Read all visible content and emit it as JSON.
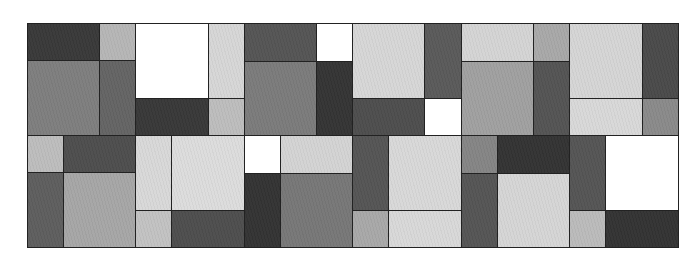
{
  "figure": {
    "bounds": {
      "x": 27,
      "y": 23,
      "width": 651,
      "height": 224
    },
    "palette": {
      "white": "#ffffff",
      "very_light": "#dadada",
      "light": "#c0c0c0",
      "mid_light": "#a6a6a6",
      "mid": "#7c7c7c",
      "mid_dark": "#5c5c5c",
      "dark": "#4a4a4a",
      "very_dark": "#353535",
      "border": "#222222"
    },
    "cells": [
      {
        "x": 27,
        "y": 23,
        "w": 72,
        "h": 37,
        "color": "#393939"
      },
      {
        "x": 99,
        "y": 23,
        "w": 36,
        "h": 37,
        "color": "#b6b6b6"
      },
      {
        "x": 27,
        "y": 60,
        "w": 72,
        "h": 75,
        "color": "#7e7e7e"
      },
      {
        "x": 99,
        "y": 60,
        "w": 36,
        "h": 75,
        "color": "#646464"
      },
      {
        "x": 135,
        "y": 23,
        "w": 73,
        "h": 75,
        "color": "#ffffff"
      },
      {
        "x": 208,
        "y": 23,
        "w": 36,
        "h": 75,
        "color": "#d6d6d6"
      },
      {
        "x": 135,
        "y": 98,
        "w": 73,
        "h": 37,
        "color": "#383838"
      },
      {
        "x": 208,
        "y": 98,
        "w": 36,
        "h": 37,
        "color": "#bdbdbd"
      },
      {
        "x": 244,
        "y": 23,
        "w": 72,
        "h": 38,
        "color": "#555555"
      },
      {
        "x": 316,
        "y": 23,
        "w": 36,
        "h": 38,
        "color": "#ffffff"
      },
      {
        "x": 244,
        "y": 61,
        "w": 72,
        "h": 74,
        "color": "#7b7b7b"
      },
      {
        "x": 316,
        "y": 61,
        "w": 36,
        "h": 74,
        "color": "#343434"
      },
      {
        "x": 352,
        "y": 23,
        "w": 72,
        "h": 75,
        "color": "#d6d6d6"
      },
      {
        "x": 424,
        "y": 23,
        "w": 37,
        "h": 75,
        "color": "#5a5a5a"
      },
      {
        "x": 352,
        "y": 98,
        "w": 72,
        "h": 37,
        "color": "#4e4e4e"
      },
      {
        "x": 424,
        "y": 98,
        "w": 37,
        "h": 37,
        "color": "#ffffff"
      },
      {
        "x": 461,
        "y": 23,
        "w": 72,
        "h": 38,
        "color": "#d4d4d4"
      },
      {
        "x": 533,
        "y": 23,
        "w": 36,
        "h": 38,
        "color": "#a8a8a8"
      },
      {
        "x": 461,
        "y": 61,
        "w": 72,
        "h": 74,
        "color": "#a0a0a0"
      },
      {
        "x": 533,
        "y": 61,
        "w": 36,
        "h": 74,
        "color": "#545454"
      },
      {
        "x": 569,
        "y": 23,
        "w": 73,
        "h": 75,
        "color": "#d5d5d5"
      },
      {
        "x": 642,
        "y": 23,
        "w": 36,
        "h": 75,
        "color": "#4a4a4a"
      },
      {
        "x": 569,
        "y": 98,
        "w": 73,
        "h": 37,
        "color": "#d8d8d8"
      },
      {
        "x": 642,
        "y": 98,
        "w": 36,
        "h": 37,
        "color": "#8a8a8a"
      },
      {
        "x": 27,
        "y": 135,
        "w": 36,
        "h": 37,
        "color": "#bdbdbd"
      },
      {
        "x": 63,
        "y": 135,
        "w": 72,
        "h": 37,
        "color": "#4e4e4e"
      },
      {
        "x": 27,
        "y": 172,
        "w": 36,
        "h": 75,
        "color": "#5e5e5e"
      },
      {
        "x": 63,
        "y": 172,
        "w": 72,
        "h": 75,
        "color": "#a6a6a6"
      },
      {
        "x": 135,
        "y": 135,
        "w": 36,
        "h": 75,
        "color": "#d8d8d8"
      },
      {
        "x": 171,
        "y": 135,
        "w": 73,
        "h": 75,
        "color": "#dcdcdc"
      },
      {
        "x": 135,
        "y": 210,
        "w": 36,
        "h": 37,
        "color": "#c2c2c2"
      },
      {
        "x": 171,
        "y": 210,
        "w": 73,
        "h": 37,
        "color": "#4e4e4e"
      },
      {
        "x": 244,
        "y": 135,
        "w": 36,
        "h": 38,
        "color": "#ffffff"
      },
      {
        "x": 280,
        "y": 135,
        "w": 72,
        "h": 38,
        "color": "#d3d3d3"
      },
      {
        "x": 244,
        "y": 173,
        "w": 36,
        "h": 74,
        "color": "#333333"
      },
      {
        "x": 280,
        "y": 173,
        "w": 72,
        "h": 74,
        "color": "#777777"
      },
      {
        "x": 352,
        "y": 135,
        "w": 36,
        "h": 75,
        "color": "#555555"
      },
      {
        "x": 388,
        "y": 135,
        "w": 73,
        "h": 75,
        "color": "#d8d8d8"
      },
      {
        "x": 352,
        "y": 210,
        "w": 36,
        "h": 37,
        "color": "#a8a8a8"
      },
      {
        "x": 388,
        "y": 210,
        "w": 73,
        "h": 37,
        "color": "#d8d8d8"
      },
      {
        "x": 461,
        "y": 135,
        "w": 36,
        "h": 38,
        "color": "#858585"
      },
      {
        "x": 497,
        "y": 135,
        "w": 72,
        "h": 38,
        "color": "#333333"
      },
      {
        "x": 461,
        "y": 173,
        "w": 36,
        "h": 74,
        "color": "#555555"
      },
      {
        "x": 497,
        "y": 173,
        "w": 72,
        "h": 74,
        "color": "#d5d5d5"
      },
      {
        "x": 569,
        "y": 135,
        "w": 36,
        "h": 75,
        "color": "#555555"
      },
      {
        "x": 605,
        "y": 135,
        "w": 73,
        "h": 75,
        "color": "#ffffff"
      },
      {
        "x": 569,
        "y": 210,
        "w": 36,
        "h": 37,
        "color": "#bbbbbb"
      },
      {
        "x": 605,
        "y": 210,
        "w": 73,
        "h": 37,
        "color": "#333333"
      }
    ]
  }
}
